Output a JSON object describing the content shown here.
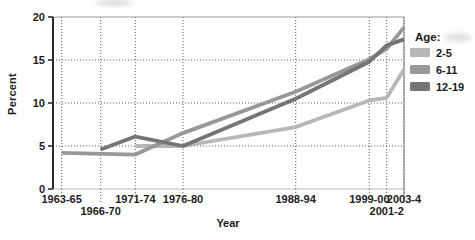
{
  "chart_data": {
    "type": "line",
    "title": "",
    "xlabel": "Year",
    "ylabel": "Percent",
    "ylim": [
      0,
      20
    ],
    "yticks": [
      0,
      5,
      10,
      15,
      20
    ],
    "grid": "dotted",
    "legend_title": "Age:",
    "legend_position": "right",
    "categories": [
      {
        "label": "1963-65",
        "year": 1964,
        "row": 1
      },
      {
        "label": "1966-70",
        "year": 1968.5,
        "row": 2
      },
      {
        "label": "1971-74",
        "year": 1972.5,
        "row": 1
      },
      {
        "label": "1976-80",
        "year": 1978,
        "row": 1
      },
      {
        "label": "1988-94",
        "year": 1991,
        "row": 1
      },
      {
        "label": "1999-00",
        "year": 1999.5,
        "row": 1
      },
      {
        "label": "2001-2",
        "year": 2001.5,
        "row": 2
      },
      {
        "label": "2003-4",
        "year": 2003.5,
        "row": 1
      }
    ],
    "series": [
      {
        "name": "2-5",
        "color": "#b7b7b7",
        "values": [
          null,
          null,
          5.0,
          5.0,
          7.2,
          10.3,
          10.6,
          13.9
        ]
      },
      {
        "name": "6-11",
        "color": "#989898",
        "values": [
          4.2,
          null,
          4.0,
          6.5,
          11.3,
          15.1,
          16.3,
          18.8
        ]
      },
      {
        "name": "12-19",
        "color": "#747474",
        "values": [
          null,
          4.6,
          6.1,
          5.0,
          10.5,
          14.8,
          16.7,
          17.4
        ]
      }
    ]
  }
}
